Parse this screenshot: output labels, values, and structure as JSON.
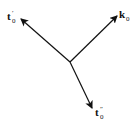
{
  "diagram": {
    "origin": {
      "x": 70,
      "y": 62
    },
    "vectors": [
      {
        "name": "t0-prime",
        "base": "t",
        "subscript": "0",
        "prime": "′",
        "tip": {
          "x": 21,
          "y": 19
        }
      },
      {
        "name": "k0",
        "base": "k",
        "subscript": "0",
        "prime": "",
        "tip": {
          "x": 117,
          "y": 16
        }
      },
      {
        "name": "t0-double-prime",
        "base": "t",
        "subscript": "0",
        "prime": "″",
        "tip": {
          "x": 92,
          "y": 108
        }
      }
    ],
    "colors": {
      "line": "#111111",
      "background": "#ffffff"
    }
  }
}
